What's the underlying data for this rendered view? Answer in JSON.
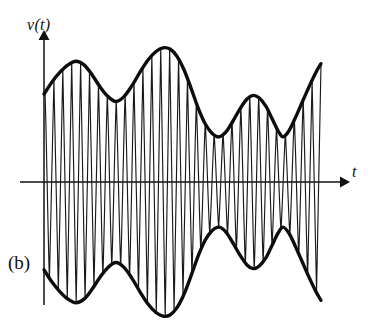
{
  "figure": {
    "panel_label": "(b)",
    "y_axis_label": "v(t)",
    "x_axis_label": "t",
    "background_color": "#ffffff",
    "ink_color": "#111111"
  },
  "chart_data": {
    "type": "line",
    "title": "",
    "subtitle": "",
    "xlabel": "t",
    "ylabel": "v(t)",
    "grid": false,
    "legend": false,
    "legend_position": "none",
    "axes": {
      "x_axis_y_px": 182,
      "y_axis_x_px": 44,
      "x_axis_start_px": 20,
      "x_axis_end_px": 345,
      "y_axis_top_px": 33,
      "y_axis_bottom_px": 305,
      "x_arrow": true,
      "y_arrow": true,
      "ticks": [],
      "tick_labels": []
    },
    "xlim": [
      44,
      322
    ],
    "ylim": [
      -1.12,
      1.12
    ],
    "series": [
      {
        "name": "upper envelope",
        "kind": "envelope-upper",
        "points": [
          [
            44,
            0.72
          ],
          [
            52,
            0.82
          ],
          [
            60,
            0.9
          ],
          [
            68,
            0.96
          ],
          [
            76,
            0.99
          ],
          [
            84,
            0.96
          ],
          [
            92,
            0.88
          ],
          [
            100,
            0.78
          ],
          [
            108,
            0.7
          ],
          [
            116,
            0.66
          ],
          [
            124,
            0.7
          ],
          [
            132,
            0.79
          ],
          [
            140,
            0.9
          ],
          [
            148,
            1.0
          ],
          [
            156,
            1.07
          ],
          [
            163,
            1.1
          ],
          [
            170,
            1.09
          ],
          [
            177,
            1.03
          ],
          [
            184,
            0.92
          ],
          [
            191,
            0.77
          ],
          [
            198,
            0.61
          ],
          [
            205,
            0.48
          ],
          [
            212,
            0.4
          ],
          [
            219,
            0.37
          ],
          [
            226,
            0.41
          ],
          [
            233,
            0.5
          ],
          [
            240,
            0.6
          ],
          [
            247,
            0.68
          ],
          [
            253,
            0.71
          ],
          [
            259,
            0.69
          ],
          [
            266,
            0.62
          ],
          [
            272,
            0.52
          ],
          [
            278,
            0.42
          ],
          [
            283,
            0.37
          ],
          [
            289,
            0.42
          ],
          [
            295,
            0.52
          ],
          [
            302,
            0.65
          ],
          [
            309,
            0.78
          ],
          [
            316,
            0.9
          ],
          [
            321,
            0.97
          ]
        ]
      },
      {
        "name": "lower envelope",
        "kind": "envelope-lower",
        "mirror_of": "upper envelope",
        "points": [
          [
            44,
            -0.72
          ],
          [
            52,
            -0.82
          ],
          [
            60,
            -0.9
          ],
          [
            68,
            -0.96
          ],
          [
            76,
            -0.99
          ],
          [
            84,
            -0.96
          ],
          [
            92,
            -0.88
          ],
          [
            100,
            -0.78
          ],
          [
            108,
            -0.7
          ],
          [
            116,
            -0.66
          ],
          [
            124,
            -0.7
          ],
          [
            132,
            -0.79
          ],
          [
            140,
            -0.9
          ],
          [
            148,
            -1.0
          ],
          [
            156,
            -1.07
          ],
          [
            163,
            -1.1
          ],
          [
            170,
            -1.09
          ],
          [
            177,
            -1.03
          ],
          [
            184,
            -0.92
          ],
          [
            191,
            -0.77
          ],
          [
            198,
            -0.61
          ],
          [
            205,
            -0.48
          ],
          [
            212,
            -0.4
          ],
          [
            219,
            -0.37
          ],
          [
            226,
            -0.41
          ],
          [
            233,
            -0.5
          ],
          [
            240,
            -0.6
          ],
          [
            247,
            -0.68
          ],
          [
            253,
            -0.71
          ],
          [
            259,
            -0.69
          ],
          [
            266,
            -0.62
          ],
          [
            272,
            -0.52
          ],
          [
            278,
            -0.42
          ],
          [
            283,
            -0.37
          ],
          [
            289,
            -0.42
          ],
          [
            295,
            -0.52
          ],
          [
            302,
            -0.65
          ],
          [
            309,
            -0.78
          ],
          [
            316,
            -0.9
          ],
          [
            321,
            -0.97
          ]
        ]
      },
      {
        "name": "carrier",
        "kind": "carrier-oscillation",
        "cycles": 31,
        "x_start": 45,
        "x_end": 321,
        "note": "High-frequency carrier filling the envelope; rendered as alternating near-vertical strokes with rounded turning points at the envelope boundaries."
      }
    ],
    "amplitude_scale_px": 122
  }
}
